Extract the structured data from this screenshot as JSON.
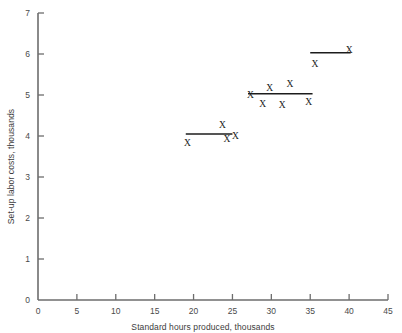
{
  "chart_data": {
    "type": "scatter",
    "title": "",
    "xlabel": "Standard hours produced, thousands",
    "ylabel": "Set-up labor costs, thousands",
    "xlim": [
      0,
      45
    ],
    "ylim": [
      0,
      7
    ],
    "xticks": [
      0,
      5,
      10,
      15,
      20,
      25,
      30,
      35,
      40,
      45
    ],
    "yticks": [
      0,
      1,
      2,
      3,
      4,
      5,
      6,
      7
    ],
    "xtick_labels": [
      "0",
      "5",
      "10",
      "15",
      "20",
      "25",
      "30",
      "35",
      "40",
      "45"
    ],
    "ytick_labels": [
      "0",
      "1",
      "2",
      "3",
      "4",
      "5",
      "6",
      "7"
    ],
    "grid": false,
    "legend": false,
    "marker_symbol": "X",
    "marker_color": "#1c1c1c",
    "axis_color": "#6d6d6d",
    "background": "#ffffff",
    "points": [
      {
        "x": 19.2,
        "y": 3.85
      },
      {
        "x": 23.7,
        "y": 4.28
      },
      {
        "x": 24.3,
        "y": 3.93
      },
      {
        "x": 25.4,
        "y": 4.02
      },
      {
        "x": 27.3,
        "y": 5.02
      },
      {
        "x": 28.9,
        "y": 4.8
      },
      {
        "x": 29.8,
        "y": 5.18
      },
      {
        "x": 31.4,
        "y": 4.78
      },
      {
        "x": 32.4,
        "y": 5.28
      },
      {
        "x": 34.8,
        "y": 4.85
      },
      {
        "x": 35.6,
        "y": 5.78
      },
      {
        "x": 40.0,
        "y": 6.12
      }
    ],
    "mean_lines": [
      {
        "x_start": 19.0,
        "x_end": 25.0,
        "y": 4.05,
        "label": "group-1-mean"
      },
      {
        "x_start": 27.0,
        "x_end": 35.3,
        "y": 5.03,
        "label": "group-2-mean"
      },
      {
        "x_start": 35.0,
        "x_end": 40.2,
        "y": 6.03,
        "label": "group-3-mean"
      }
    ]
  }
}
